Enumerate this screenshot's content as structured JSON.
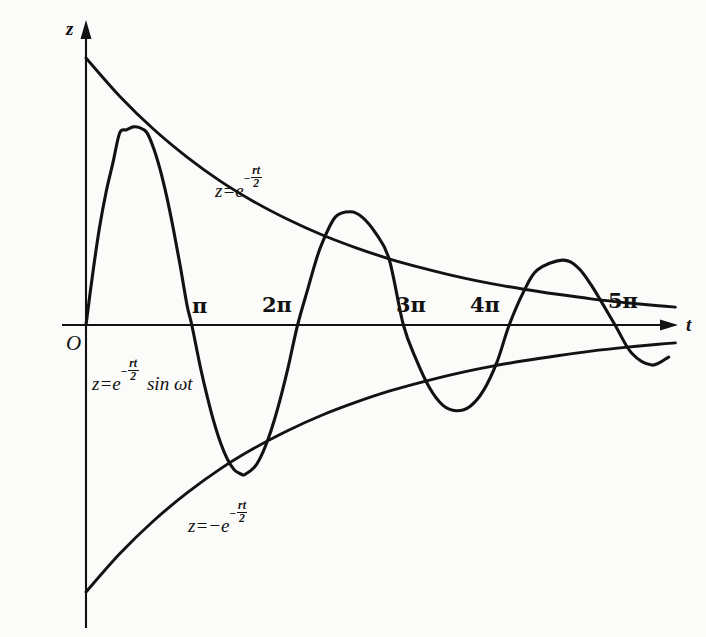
{
  "figure": {
    "background_color": "#fbfbfa",
    "ink_color": "#121212",
    "width": 706,
    "height": 637
  },
  "axes": {
    "y_axis_label": "z",
    "x_axis_label": "t",
    "origin_label": "O",
    "x_ticks": [
      {
        "label": "π",
        "value": 3.14159,
        "px": 188
      },
      {
        "label": "2π",
        "value": 6.28319,
        "px": 290
      },
      {
        "label": "3π",
        "value": 9.42478,
        "px": 395
      },
      {
        "label": "4π",
        "value": 12.56637,
        "px": 495
      },
      {
        "label": "5π",
        "value": 15.70796,
        "px": 615
      }
    ]
  },
  "labels": {
    "upper_envelope": {
      "lead": "z=e",
      "exp_minus": "−",
      "exp_num": "rt",
      "exp_den": "2"
    },
    "lower_envelope": {
      "lead": "z=−e",
      "exp_minus": "−",
      "exp_num": "rt",
      "exp_den": "2"
    },
    "main_curve": {
      "lead": "z=e",
      "exp_minus": "−",
      "exp_num": "rt",
      "exp_den": "2",
      "trail": "sin ωt"
    }
  },
  "chart_data": {
    "type": "line",
    "title": "",
    "xlabel": "t",
    "ylabel": "z",
    "grid": false,
    "legend": "none",
    "xlim": [
      0,
      17.5
    ],
    "ylim": [
      -1.08,
      1.08
    ],
    "decay_rate_r_over_2": 0.155,
    "angular_frequency_omega": 1,
    "annotations": [
      {
        "text": "z=e^(-rt/2)",
        "x": 4.3,
        "y": 0.6,
        "role": "upper-envelope-label"
      },
      {
        "text": "z=-e^(-rt/2)",
        "x": 3.5,
        "y": -0.62,
        "role": "lower-envelope-label"
      },
      {
        "text": "z=e^(-rt/2) sin wt",
        "x": 0.4,
        "y": -0.12,
        "role": "main-curve-label"
      },
      {
        "text": "O",
        "x": -0.3,
        "y": -0.08,
        "role": "origin-label"
      }
    ],
    "series": [
      {
        "name": "z = e^(-rt/2) sin wt",
        "role": "damped-sine",
        "x": [
          0.0,
          0.2,
          0.4,
          0.6,
          0.8,
          1.0,
          1.2,
          1.4,
          1.5708,
          1.8,
          2.0,
          2.2,
          2.4,
          2.6,
          2.8,
          3.0,
          3.14159,
          3.4,
          3.6,
          3.8,
          4.0,
          4.2,
          4.4,
          4.6,
          4.7124,
          5.0,
          5.2,
          5.4,
          5.6,
          5.8,
          6.0,
          6.28319,
          6.6,
          6.8,
          7.0,
          7.4,
          7.8539,
          8.2,
          8.6,
          9.0,
          9.42478,
          9.8,
          10.2,
          10.6,
          10.9956,
          11.4,
          11.8,
          12.2,
          12.56637,
          13.0,
          13.4,
          14.1372,
          14.6,
          15.0,
          15.70796,
          16.2,
          16.8,
          17.3
        ],
        "y": [
          0.0,
          0.193,
          0.364,
          0.5,
          0.608,
          0.719,
          0.731,
          0.742,
          0.74,
          0.722,
          0.665,
          0.583,
          0.479,
          0.356,
          0.22,
          0.074,
          0.0,
          -0.16,
          -0.268,
          -0.364,
          -0.443,
          -0.503,
          -0.542,
          -0.558,
          -0.56,
          -0.533,
          -0.491,
          -0.43,
          -0.353,
          -0.262,
          -0.16,
          0.0,
          0.141,
          0.229,
          0.303,
          0.404,
          0.424,
          0.404,
          0.344,
          0.247,
          0.0,
          -0.128,
          -0.235,
          -0.301,
          -0.321,
          -0.305,
          -0.246,
          -0.14,
          0.0,
          0.126,
          0.206,
          0.243,
          0.216,
          0.15,
          0.0,
          -0.105,
          -0.15,
          -0.12
        ]
      },
      {
        "name": "z = e^(-rt/2)",
        "role": "upper-envelope",
        "x": [
          0.0,
          1.0,
          2.0,
          3.0,
          4.0,
          5.0,
          6.0,
          7.0,
          8.0,
          9.0,
          10.0,
          11.0,
          12.0,
          13.0,
          14.0,
          15.0,
          16.0,
          17.0,
          17.5
        ],
        "y": [
          1.0,
          0.857,
          0.734,
          0.629,
          0.538,
          0.461,
          0.395,
          0.338,
          0.29,
          0.248,
          0.213,
          0.182,
          0.156,
          0.134,
          0.115,
          0.098,
          0.084,
          0.072,
          0.067
        ]
      },
      {
        "name": "z = -e^(-rt/2)",
        "role": "lower-envelope",
        "x": [
          0.0,
          1.0,
          2.0,
          3.0,
          4.0,
          5.0,
          6.0,
          7.0,
          8.0,
          9.0,
          10.0,
          11.0,
          12.0,
          13.0,
          14.0,
          15.0,
          16.0,
          17.0,
          17.5
        ],
        "y": [
          -1.0,
          -0.857,
          -0.734,
          -0.629,
          -0.538,
          -0.461,
          -0.395,
          -0.338,
          -0.29,
          -0.248,
          -0.213,
          -0.182,
          -0.156,
          -0.134,
          -0.115,
          -0.098,
          -0.084,
          -0.072,
          -0.067
        ]
      }
    ]
  }
}
